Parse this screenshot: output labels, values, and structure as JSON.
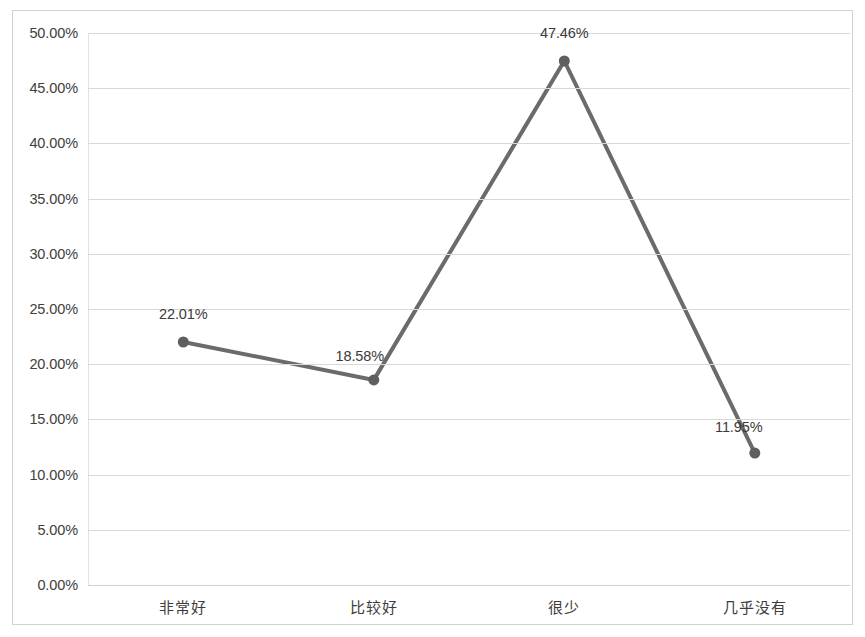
{
  "chart_data": {
    "type": "line",
    "title": "",
    "subtitle": "",
    "xlabel": "",
    "ylabel": "",
    "categories": [
      "非常好",
      "比较好",
      "很少",
      "几乎没有"
    ],
    "values": [
      22.01,
      18.58,
      47.46,
      11.95
    ],
    "value_labels": [
      "22.01%",
      "18.58%",
      "47.46%",
      "11.95%"
    ],
    "series": [
      {
        "name": "",
        "values": [
          22.01,
          18.58,
          47.46,
          11.95
        ]
      }
    ],
    "ylim": [
      0,
      50
    ],
    "y_tick_step": 5,
    "y_tick_labels": [
      "50.00%",
      "45.00%",
      "40.00%",
      "35.00%",
      "30.00%",
      "25.00%",
      "20.00%",
      "15.00%",
      "10.00%",
      "5.00%",
      "0.00%"
    ],
    "y_tick_values": [
      50,
      45,
      40,
      35,
      30,
      25,
      20,
      15,
      10,
      5,
      0
    ],
    "grid": true,
    "grid_axis": "y",
    "legend": false,
    "legend_position": "none",
    "markers": true,
    "colors": {
      "line": "#6b6b6b",
      "marker": "#5f5f5f",
      "gridline": "#d9d9d9",
      "frame": "#d2d2d2",
      "tick_text": "#404040",
      "label_text": "#3a3a3a",
      "background": "#ffffff"
    },
    "annotations": [
      {
        "text": "22.01%",
        "category": "非常好",
        "value": 22.01,
        "placement": "above"
      },
      {
        "text": "18.58%",
        "category": "比较好",
        "value": 18.58,
        "placement": "above-left"
      },
      {
        "text": "47.46%",
        "category": "很少",
        "value": 47.46,
        "placement": "above"
      },
      {
        "text": "11.95%",
        "category": "几乎没有",
        "value": 11.95,
        "placement": "above-left"
      }
    ]
  }
}
